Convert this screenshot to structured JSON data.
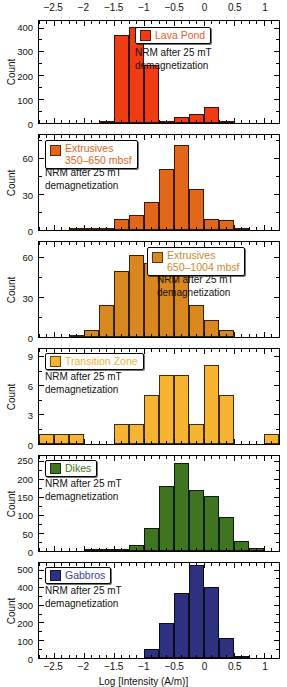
{
  "figure": {
    "xlabel": "Log [Intensity (A/m)]",
    "ylabel": "Count",
    "xlim": [
      -2.75,
      1.25
    ],
    "xticks": [
      -2.5,
      -2,
      -1.5,
      -1,
      -0.5,
      0,
      0.5,
      1
    ],
    "xticklabels": [
      "−2.5",
      "−2",
      "−1.5",
      "−1",
      "−0.5",
      "0",
      "0.5",
      "1"
    ],
    "annotation_line1": "NRM after 25 mT",
    "annotation_line2": "demagnetization"
  },
  "chart_data": [
    {
      "type": "bar",
      "title": "Lava Pond",
      "legend_label": "Lava Pond",
      "legend_label2": "",
      "color": "#F03C12",
      "text_color": "#F0582E",
      "xlabel": "",
      "ylabel": "Count",
      "ylim": [
        0,
        430
      ],
      "yticks": [
        0,
        100,
        200,
        300,
        400
      ],
      "yticklabels": [
        "0",
        "100",
        "200",
        "300",
        "400"
      ],
      "bin_width": 0.25,
      "bin_starts": [
        -1.75,
        -1.5,
        -1.25,
        -1.0,
        -0.75,
        -0.5,
        -0.25,
        0.0,
        0.25
      ],
      "values": [
        6,
        365,
        396,
        240,
        0,
        25,
        38,
        65,
        4
      ],
      "annotation": "NRM after 25 mT demagnetization"
    },
    {
      "type": "bar",
      "title": "Extrusives 350–650 mbsf",
      "legend_label": "Extrusives",
      "legend_label2": "350–650 mbsf",
      "color": "#E2671B",
      "text_color": "#E2671B",
      "xlabel": "",
      "ylabel": "Count",
      "ylim": [
        0,
        80
      ],
      "yticks": [
        0,
        30,
        60
      ],
      "yticklabels": [
        "0",
        "30",
        "60"
      ],
      "bin_width": 0.25,
      "bin_starts": [
        -2.25,
        -2.0,
        -1.75,
        -1.5,
        -1.25,
        -1.0,
        -0.75,
        -0.5,
        -0.25,
        0.0,
        0.25,
        0.5
      ],
      "values": [
        1,
        1,
        2,
        9,
        12,
        23,
        50,
        70,
        34,
        9,
        8,
        2
      ],
      "annotation": "NRM after 25 mT demagnetization"
    },
    {
      "type": "bar",
      "title": "Extrusives 650–1004 mbsf",
      "legend_label": "Extrusives",
      "legend_label2": "650–1004 mbsf",
      "color": "#D98820",
      "text_color": "#C98A2E",
      "xlabel": "",
      "ylabel": "Count",
      "ylim": [
        0,
        72
      ],
      "yticks": [
        0,
        30,
        60
      ],
      "yticklabels": [
        "0",
        "30",
        "60"
      ],
      "bin_width": 0.25,
      "bin_starts": [
        -2.25,
        -2.0,
        -1.75,
        -1.5,
        -1.25,
        -1.0,
        -0.75,
        -0.5,
        -0.25,
        0.0,
        0.25
      ],
      "values": [
        1,
        5,
        24,
        49,
        61,
        55,
        60,
        46,
        24,
        13,
        5
      ],
      "annotation": "NRM after 25 mT demagnetization"
    },
    {
      "type": "bar",
      "title": "Transition Zone",
      "legend_label": "Transition Zone",
      "legend_label2": "",
      "color": "#F7B431",
      "text_color": "#F3B233",
      "xlabel": "",
      "ylabel": "Count",
      "ylim": [
        0,
        9.8
      ],
      "yticks": [
        0,
        3,
        6,
        9
      ],
      "yticklabels": [
        "0",
        "3",
        "6",
        "9"
      ],
      "bin_width": 0.25,
      "bin_starts": [
        -2.75,
        -2.5,
        -2.25,
        -1.5,
        -1.25,
        -1.0,
        -0.75,
        -0.5,
        -0.25,
        0.0,
        0.25,
        1.0
      ],
      "values": [
        1,
        1,
        1,
        2,
        2,
        5,
        7,
        7,
        2,
        8,
        5,
        1
      ],
      "annotation": "NRM after 25 mT demagnetization"
    },
    {
      "type": "bar",
      "title": "Dikes",
      "legend_label": "Dikes",
      "legend_label2": "",
      "color": "#3F7521",
      "text_color": "#3F7521",
      "xlabel": "",
      "ylabel": "Count",
      "ylim": [
        0,
        265
      ],
      "yticks": [
        0,
        50,
        100,
        150,
        200,
        250
      ],
      "yticklabels": [
        "0",
        "50",
        "100",
        "150",
        "200",
        "250"
      ],
      "bin_width": 0.25,
      "bin_starts": [
        -2.0,
        -1.75,
        -1.5,
        -1.25,
        -1.0,
        -0.75,
        -0.5,
        -0.25,
        0.0,
        0.25,
        0.5,
        0.75
      ],
      "values": [
        2,
        3,
        4,
        16,
        64,
        178,
        240,
        168,
        150,
        92,
        27,
        7
      ],
      "annotation": "NRM after 25 mT demagnetization"
    },
    {
      "type": "bar",
      "title": "Gabbros",
      "legend_label": "Gabbros",
      "legend_label2": "",
      "color": "#2E3180",
      "text_color": "#3A3E92",
      "xlabel": "Log [Intensity (A/m)]",
      "ylabel": "Count",
      "ylim": [
        0,
        540
      ],
      "yticks": [
        0,
        100,
        200,
        300,
        400,
        500
      ],
      "yticklabels": [
        "0",
        "100",
        "200",
        "300",
        "400",
        "500"
      ],
      "bin_width": 0.25,
      "bin_starts": [
        -1.0,
        -0.75,
        -0.5,
        -0.25,
        0.0,
        0.25,
        0.5
      ],
      "values": [
        52,
        196,
        362,
        518,
        394,
        110,
        13
      ],
      "annotation": "NRM after 25 mT demagnetization"
    }
  ],
  "panel_layout": [
    {
      "top": 20,
      "height": 104,
      "legend_right": true,
      "legend_x": 96,
      "legend_y": 6,
      "note_x": 96,
      "note_y": 26
    },
    {
      "top": 134,
      "height": 97,
      "legend_right": false,
      "legend_x": 6,
      "legend_y": 5,
      "note_x": 6,
      "note_y": 32
    },
    {
      "top": 241,
      "height": 97,
      "legend_right": true,
      "legend_x": 108,
      "legend_y": 5,
      "note_x": 118,
      "note_y": 32
    },
    {
      "top": 348,
      "height": 97,
      "legend_right": false,
      "legend_x": 6,
      "legend_y": 4,
      "note_x": 6,
      "note_y": 22
    },
    {
      "top": 455,
      "height": 97,
      "legend_right": false,
      "legend_x": 6,
      "legend_y": 4,
      "note_x": 6,
      "note_y": 22
    },
    {
      "top": 562,
      "height": 97,
      "legend_right": false,
      "legend_x": 6,
      "legend_y": 4,
      "note_x": 6,
      "note_y": 22
    }
  ]
}
